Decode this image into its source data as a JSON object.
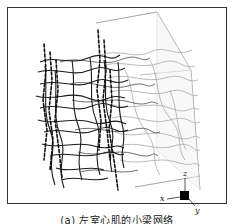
{
  "figure": {
    "caption": "(a)  左室心肌的小梁网络",
    "axes": {
      "x_label": "x",
      "y_label": "y",
      "z_label": "z"
    },
    "colors": {
      "fiber_dark": "#1a1a1a",
      "fiber_mid": "#555555",
      "fiber_light": "#9a9a9a",
      "box_outline": "#888888",
      "frame": "#333333"
    }
  }
}
